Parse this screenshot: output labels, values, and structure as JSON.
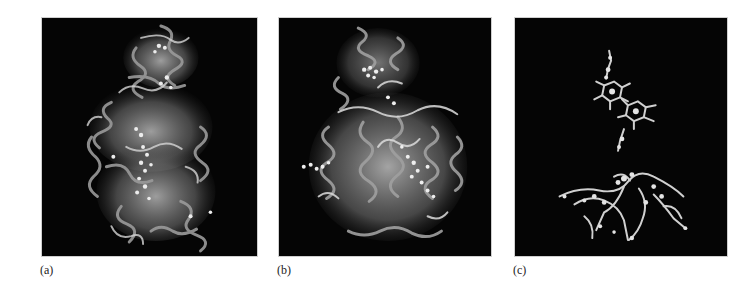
{
  "figure": {
    "panels": [
      {
        "id": "a",
        "label": "(a)",
        "content": "protein ribbon structure, side view"
      },
      {
        "id": "b",
        "label": "(b)",
        "content": "protein ribbon structure with cofactors, rotated view"
      },
      {
        "id": "c",
        "label": "(c)",
        "content": "cofactors / prosthetic groups only (ball-and-stick)"
      }
    ],
    "colors": {
      "panel_background": "#050505",
      "ribbon": "#9a9a9a",
      "ribbon_highlight": "#e8e8e8",
      "ligand": "#d8d8d8",
      "page_background": "#ffffff"
    }
  }
}
